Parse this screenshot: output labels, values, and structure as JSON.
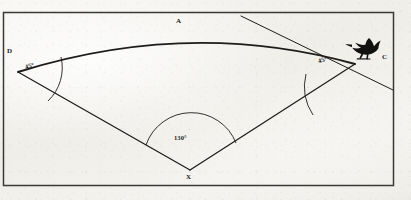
{
  "figure": {
    "background_color": "#f2f1ed",
    "ink_color": "#1d1c1a",
    "frame": {
      "color": "#3a3936",
      "x": 3,
      "y": 12,
      "width": 391,
      "height": 174
    },
    "vertex_labels": [
      {
        "id": "A",
        "text": "A",
        "x": 176,
        "y": 18,
        "role": "arc-label-top"
      },
      {
        "id": "D",
        "text": "D",
        "x": 7,
        "y": 48,
        "role": "left-vertex-label"
      },
      {
        "id": "C",
        "text": "C",
        "x": 382,
        "y": 54,
        "role": "right-vertex-label"
      },
      {
        "id": "X",
        "text": "X",
        "x": 186,
        "y": 174,
        "role": "bottom-vertex-label"
      }
    ],
    "angle_labels": [
      {
        "id": "angle-d",
        "text": "45°",
        "x": 25,
        "y": 63,
        "rotation": -16,
        "vertex": "D"
      },
      {
        "id": "angle-c",
        "text": "45°",
        "x": 318,
        "y": 57,
        "rotation": -16,
        "vertex": "C"
      },
      {
        "id": "angle-x",
        "text": "130°",
        "x": 174,
        "y": 135,
        "rotation": 0,
        "vertex": "X"
      }
    ],
    "points": {
      "D": {
        "x": 18,
        "y": 72
      },
      "C": {
        "x": 355,
        "y": 64
      },
      "X": {
        "x": 190,
        "y": 170
      }
    },
    "elements": {
      "arc_dc": "curved arc from D to C bulging upward through A",
      "segment_dx": "straight line from D to X",
      "segment_xc": "straight line from X to C",
      "tangent_line": "straight line through C extending up-left to top border and down-right to right border",
      "arc_marker_d": "angle arc at vertex D",
      "arc_marker_c": "angle arc at vertex C",
      "arc_marker_x": "angle arc at vertex X",
      "bird": "dark bird silhouette perched near point C"
    },
    "bird": {
      "x": 352,
      "y": 40,
      "width": 30,
      "height": 26,
      "color": "#111110"
    }
  }
}
